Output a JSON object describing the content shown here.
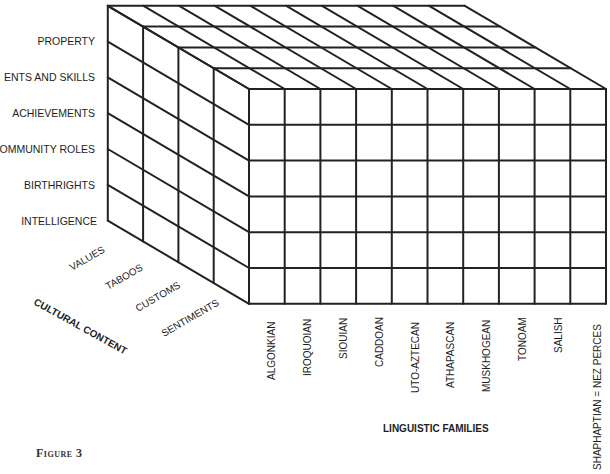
{
  "figure": {
    "caption": "Figure 3"
  },
  "cube": {
    "front_origin": [
      249,
      89
    ],
    "cell": 35.7,
    "front_cell_h": 35.8,
    "depth_vector": [
      -35.3,
      -20.8
    ],
    "columns": 10,
    "rows": 6,
    "layers": 4,
    "stroke_color": "#222222"
  },
  "axes": {
    "vertical": {
      "title": "",
      "labels": [
        "PROPERTY",
        "TALENTS AND SKILLS",
        "ACHIEVEMENTS",
        "COMMUNITY ROLES",
        "BIRTHRIGHTS",
        "INTELLIGENCE"
      ],
      "visible_labels": [
        "PROPERTY",
        "ENTS AND SKILLS",
        "ACHIEVEMENTS",
        "OMMUNITY ROLES",
        "BIRTHRIGHTS",
        "INTELLIGENCE"
      ]
    },
    "depth": {
      "title": "CULTURAL CONTENT",
      "labels": [
        "VALUES",
        "TABOOS",
        "CUSTOMS",
        "SENTIMENTS"
      ]
    },
    "horizontal": {
      "title": "LINGUISTIC FAMILIES",
      "labels": [
        "ALGONKIAN",
        "IROQUOIAN",
        "SIOUIAN",
        "CADDOAN",
        "UTO-AZTECAN",
        "ATHAPASCAN",
        "MUSKHOGEAN",
        "TONOAM",
        "SALISH",
        "SHAPHAPTIAN = NEZ PERCES"
      ]
    }
  }
}
